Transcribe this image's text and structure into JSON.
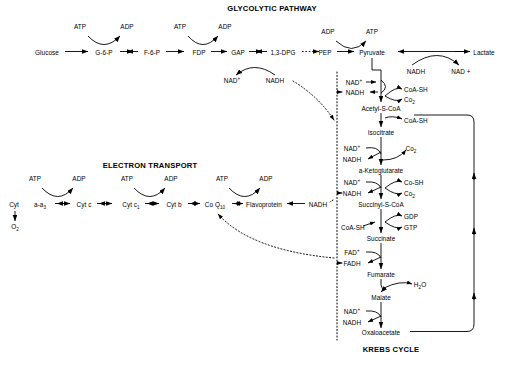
{
  "diagram": {
    "titles": [
      {
        "id": "glycolysis-title",
        "text": "GLYCOLYTIC PATHWAY",
        "x": 272,
        "y": 9
      },
      {
        "id": "electron-transport-title",
        "text": "ELECTRON TRANSPORT",
        "x": 150,
        "y": 166
      },
      {
        "id": "krebs-cycle-title",
        "text": "KREBS CYCLE",
        "x": 391,
        "y": 350
      }
    ],
    "glycolysis": {
      "name": "GLYCOLYTIC PATHWAY",
      "main_chain": [
        "Glucose",
        "G-6-P",
        "F-6-P",
        "FDP",
        "GAP",
        "1,3-DPG",
        "PEP",
        "Pyruvate"
      ],
      "end_product": "Lactate",
      "cofactors": [
        "ATP",
        "ADP",
        "ATP",
        "ADP",
        "NAD",
        "NADH",
        "ADP",
        "ATP",
        "NADH",
        "NAD +"
      ]
    },
    "krebs": {
      "name": "KREBS CYCLE",
      "intermediates": [
        "Acetyl-S-CoA",
        "Isocitrate",
        "a-Ketoglutarate",
        "Succinyl-S-CoA",
        "Succinate",
        "Fumarate",
        "Malate",
        "Oxaloacetate"
      ],
      "cofactors": [
        "NAD",
        "NADH",
        "CoA-SH",
        "Co2",
        "CoA-SH",
        "Co2",
        "Co-SH",
        "Co2",
        "GDP",
        "GTP",
        "FAD",
        "FADH",
        "H2O",
        "NAD",
        "NADH"
      ]
    },
    "electron_transport": {
      "name": "ELECTRON TRANSPORT",
      "carriers": [
        "Cyt a-a3",
        "Cyt c",
        "Cyt c1",
        "Cyt b",
        "Co Q10",
        "Flavoprotein"
      ],
      "inputs": [
        "NADH"
      ],
      "outputs": [
        "O2"
      ],
      "cofactors": [
        "ATP",
        "ADP",
        "ATP",
        "ADP",
        "ATP",
        "ADP"
      ]
    },
    "labels": [
      {
        "id": "lbl-atp-1",
        "html": "ATP",
        "x": 80,
        "y": 28,
        "center": true
      },
      {
        "id": "lbl-adp-1",
        "html": "ADP",
        "x": 127,
        "y": 28,
        "center": true
      },
      {
        "id": "lbl-atp-2",
        "html": "ATP",
        "x": 180,
        "y": 28,
        "center": true
      },
      {
        "id": "lbl-adp-2",
        "html": "ADP",
        "x": 225,
        "y": 28,
        "center": true
      },
      {
        "id": "lbl-adp-3",
        "html": "ADP",
        "x": 328,
        "y": 33,
        "center": true
      },
      {
        "id": "lbl-atp-3",
        "html": "ATP",
        "x": 372,
        "y": 33,
        "center": true
      },
      {
        "id": "lbl-glucose",
        "html": "Glucose",
        "x": 47,
        "y": 54,
        "center": true
      },
      {
        "id": "lbl-g6p",
        "html": "G-6-P",
        "x": 104,
        "y": 54,
        "center": true
      },
      {
        "id": "lbl-f6p",
        "html": "F-6-P",
        "x": 152,
        "y": 54,
        "center": true
      },
      {
        "id": "lbl-fdp",
        "html": "FDP",
        "x": 199,
        "y": 54,
        "center": true
      },
      {
        "id": "lbl-gap",
        "html": "GAP",
        "x": 238,
        "y": 54,
        "center": true
      },
      {
        "id": "lbl-13dpg",
        "html": "1,3-DPG",
        "x": 283,
        "y": 54,
        "center": true
      },
      {
        "id": "lbl-pep",
        "html": "PEP",
        "x": 325,
        "y": 54,
        "center": true
      },
      {
        "id": "lbl-pyruvate",
        "html": "Pyruvate",
        "x": 372,
        "y": 54,
        "center": true
      },
      {
        "id": "lbl-lactate",
        "html": "Lactate",
        "x": 484,
        "y": 54,
        "center": true
      },
      {
        "id": "lbl-nad-glyc",
        "html": "NAD<sup>+</sup>",
        "x": 232,
        "y": 82,
        "center": true
      },
      {
        "id": "lbl-nadh-glyc",
        "html": "NADH",
        "x": 275,
        "y": 82,
        "center": true
      },
      {
        "id": "lbl-nadh-lactate",
        "html": "NADH",
        "x": 416,
        "y": 73,
        "center": true
      },
      {
        "id": "lbl-nadplus-lactate",
        "html": "NAD +",
        "x": 461,
        "y": 73,
        "center": true
      },
      {
        "id": "lbl-nad-pyr",
        "html": "NAD<sup>+</sup>",
        "x": 354,
        "y": 84,
        "center": true
      },
      {
        "id": "lbl-nadh-pyr",
        "html": "NADH",
        "x": 355,
        "y": 94,
        "center": true
      },
      {
        "id": "lbl-coash-1",
        "html": "CoA-SH",
        "x": 404,
        "y": 91,
        "center": false
      },
      {
        "id": "lbl-co2-1",
        "html": "Co<sub>2</sub>",
        "x": 404,
        "y": 101,
        "center": false
      },
      {
        "id": "lbl-acetyl-s-coa",
        "html": "Acetyl-S-CoA",
        "x": 381,
        "y": 110,
        "center": true
      },
      {
        "id": "lbl-coash-2",
        "html": "CoA-SH",
        "x": 404,
        "y": 122,
        "center": false
      },
      {
        "id": "lbl-isocitrate",
        "html": "Isocitrate",
        "x": 381,
        "y": 134,
        "center": true
      },
      {
        "id": "lbl-nad-iso",
        "html": "NAD<sup>+</sup>",
        "x": 352,
        "y": 150,
        "center": true
      },
      {
        "id": "lbl-nadh-iso",
        "html": "NADH",
        "x": 352,
        "y": 161,
        "center": true
      },
      {
        "id": "lbl-co2-2",
        "html": "Co<sub>2</sub>",
        "x": 411,
        "y": 150,
        "center": true
      },
      {
        "id": "lbl-ketoglutarate",
        "html": "a-Ketoglutarate",
        "x": 381,
        "y": 172,
        "center": true
      },
      {
        "id": "lbl-nad-kg",
        "html": "NAD<sup>+</sup>",
        "x": 352,
        "y": 184,
        "center": true
      },
      {
        "id": "lbl-nadh-kg",
        "html": "NADH",
        "x": 352,
        "y": 195,
        "center": true
      },
      {
        "id": "lbl-cosh",
        "html": "Co-SH",
        "x": 404,
        "y": 184,
        "center": false
      },
      {
        "id": "lbl-co2-3",
        "html": "Co<sub>2</sub>",
        "x": 404,
        "y": 195,
        "center": false
      },
      {
        "id": "lbl-succinyl",
        "html": "Succinyl-S-CoA",
        "x": 381,
        "y": 206,
        "center": true
      },
      {
        "id": "lbl-gdp",
        "html": "GDP",
        "x": 404,
        "y": 218,
        "center": false
      },
      {
        "id": "lbl-gtp",
        "html": "GTP",
        "x": 404,
        "y": 229,
        "center": false
      },
      {
        "id": "lbl-coash-3",
        "html": "CoA-SH",
        "x": 341,
        "y": 229,
        "center": false
      },
      {
        "id": "lbl-succinate",
        "html": "Succinate",
        "x": 381,
        "y": 240,
        "center": true
      },
      {
        "id": "lbl-fad",
        "html": "FAD<sup>+</sup>",
        "x": 352,
        "y": 254,
        "center": true
      },
      {
        "id": "lbl-fadh",
        "html": "FADH",
        "x": 352,
        "y": 265,
        "center": true
      },
      {
        "id": "lbl-fumarate",
        "html": "Fumarate",
        "x": 381,
        "y": 276,
        "center": true
      },
      {
        "id": "lbl-h2o",
        "html": "H<sub>2</sub>O",
        "x": 420,
        "y": 286,
        "center": true
      },
      {
        "id": "lbl-malate",
        "html": "Malate",
        "x": 381,
        "y": 299,
        "center": true
      },
      {
        "id": "lbl-nad-mal",
        "html": "NAD<sup>+</sup>",
        "x": 352,
        "y": 313,
        "center": true
      },
      {
        "id": "lbl-nadh-mal",
        "html": "NADH",
        "x": 352,
        "y": 324,
        "center": true
      },
      {
        "id": "lbl-oxaloacetate",
        "html": "Oxaloacetate",
        "x": 381,
        "y": 334,
        "center": true
      },
      {
        "id": "lbl-atp-et-1",
        "html": "ATP",
        "x": 35,
        "y": 180,
        "center": true
      },
      {
        "id": "lbl-adp-et-1",
        "html": "ADP",
        "x": 79,
        "y": 180,
        "center": true
      },
      {
        "id": "lbl-atp-et-2",
        "html": "ATP",
        "x": 127,
        "y": 180,
        "center": true
      },
      {
        "id": "lbl-adp-et-2",
        "html": "ADP",
        "x": 171,
        "y": 180,
        "center": true
      },
      {
        "id": "lbl-atp-et-3",
        "html": "ATP",
        "x": 222,
        "y": 180,
        "center": true
      },
      {
        "id": "lbl-adp-et-3",
        "html": "ADP",
        "x": 266,
        "y": 180,
        "center": true
      },
      {
        "id": "lbl-cyt",
        "html": "Cyt",
        "x": 14,
        "y": 206,
        "center": true
      },
      {
        "id": "lbl-cyt-aa3",
        "html": "a-a<sub>3</sub>",
        "x": 40,
        "y": 206,
        "center": true
      },
      {
        "id": "lbl-cyt-c",
        "html": "Cyt c",
        "x": 84,
        "y": 206,
        "center": true
      },
      {
        "id": "lbl-cyt-c1",
        "html": "Cyt c<sub>1</sub>",
        "x": 131,
        "y": 206,
        "center": true
      },
      {
        "id": "lbl-cyt-b",
        "html": "Cyt b",
        "x": 174,
        "y": 206,
        "center": true
      },
      {
        "id": "lbl-coq10",
        "html": "Co Q<sub>10</sub>",
        "x": 215,
        "y": 206,
        "center": true
      },
      {
        "id": "lbl-flavoprotein",
        "html": "Flavoprotein",
        "x": 264,
        "y": 206,
        "center": true
      },
      {
        "id": "lbl-nadh-et",
        "html": "NADH",
        "x": 318,
        "y": 206,
        "center": true
      },
      {
        "id": "lbl-o2",
        "html": "O<sub>2</sub>",
        "x": 15,
        "y": 228,
        "center": true
      }
    ]
  }
}
